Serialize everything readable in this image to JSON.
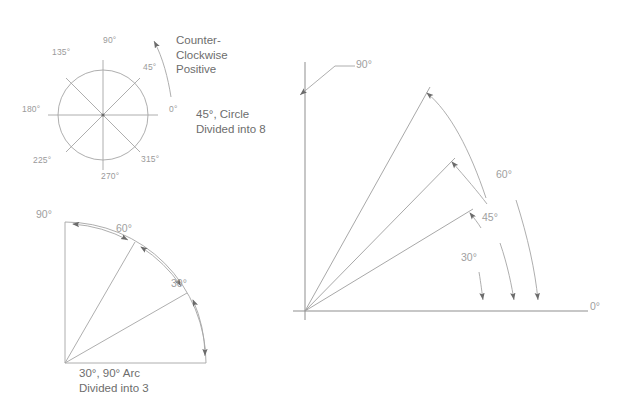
{
  "canvas": {
    "width": 617,
    "height": 408,
    "background": "#ffffff"
  },
  "style": {
    "line_color": "#9e9e9e",
    "line_color_light": "#b3b3b3",
    "arrow_color": "#6b6b6b",
    "label_color": "#9a9a9a",
    "text_color": "#6d6d6d"
  },
  "figure_circle": {
    "name": "circle-divided-into-8",
    "center": {
      "x": 103,
      "y": 115
    },
    "radius": 45,
    "divisions": 8,
    "step_degrees": 45,
    "tick_labels": [
      {
        "text": "0°",
        "angle": 0,
        "x": 172,
        "y": 110
      },
      {
        "text": "45°",
        "angle": 45,
        "x": 145,
        "y": 66
      },
      {
        "text": "90°",
        "angle": 90,
        "x": 103,
        "y": 40
      },
      {
        "text": "135°",
        "angle": 135,
        "x": 53,
        "y": 52
      },
      {
        "text": "180°",
        "angle": 180,
        "x": 23,
        "y": 110
      },
      {
        "text": "225°",
        "angle": 225,
        "x": 35,
        "y": 160
      },
      {
        "text": "270°",
        "angle": 270,
        "x": 104,
        "y": 183
      },
      {
        "text": "315°",
        "angle": 315,
        "x": 143,
        "y": 159
      }
    ],
    "rotation_note": "Counter-\nClockwise\nPositive",
    "rotation_note_lines": [
      "Counter-",
      "Clockwise",
      "Positive"
    ],
    "rotation_direction": "counter-clockwise",
    "caption_lines": [
      "45°, Circle",
      "Divided into 8"
    ]
  },
  "figure_arc": {
    "name": "arc-divided-into-3",
    "origin": {
      "x": 65,
      "y": 363
    },
    "radius": 100,
    "divisions": 3,
    "step_degrees": 30,
    "ray_angles": [
      0,
      30,
      60,
      90
    ],
    "dimension_labels": [
      {
        "text": "90°",
        "x": 38,
        "y": 212
      },
      {
        "text": "60°",
        "x": 117,
        "y": 227
      },
      {
        "text": "30°",
        "x": 172,
        "y": 282
      }
    ],
    "caption_lines": [
      "30°, 90° Arc",
      "Divided into 3"
    ]
  },
  "figure_rays": {
    "name": "angle-rays-diagram",
    "origin": {
      "x": 305,
      "y": 311
    },
    "x_axis_end": {
      "x": 588,
      "y": 311
    },
    "y_axis_end": {
      "x": 305,
      "y": 62
    },
    "ray_angles": [
      30,
      45,
      60
    ],
    "ray_length": 235,
    "labels": [
      {
        "text": "90°",
        "x": 357,
        "y": 62
      },
      {
        "text": "60°",
        "x": 497,
        "y": 172
      },
      {
        "text": "45°",
        "x": 483,
        "y": 215
      },
      {
        "text": "30°",
        "x": 462,
        "y": 255
      },
      {
        "text": "0°",
        "x": 590,
        "y": 303
      }
    ]
  }
}
